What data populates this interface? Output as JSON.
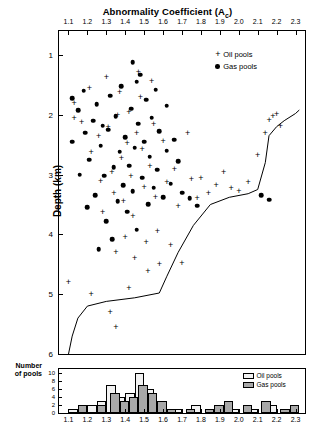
{
  "title": {
    "text": "Abnormality Coefficient (A",
    "sub": "c",
    "tail": ")"
  },
  "axes": {
    "x_label_top_ticks": [
      "1.1",
      "1.2",
      "1.3",
      "1.4",
      "1.5",
      "1.6",
      "1.7",
      "1.8",
      "1.9",
      "2.0",
      "2.1",
      "2.2",
      "2.3"
    ],
    "y_label": "Depth (km)",
    "y_ticks": [
      "1",
      "2",
      "3",
      "4",
      "5",
      "6"
    ],
    "hist_y_label_line1": "Number",
    "hist_y_label_line2": "of pools",
    "hist_y_ticks": [
      "0",
      "2",
      "4",
      "6",
      "8",
      "10"
    ],
    "hist_x_ticks": [
      "1.1",
      "1.2",
      "1.3",
      "1.4",
      "1.5",
      "1.6",
      "1.7",
      "1.8",
      "1.9",
      "2.0",
      "2.1",
      "2.2",
      "2.3"
    ]
  },
  "legend": {
    "oil": "Oil pools",
    "gas": "Gas pools"
  },
  "hist_legend": {
    "oil": "Oil pools",
    "gas": "Gas pools"
  },
  "colors": {
    "oil_bar": "#f2f2f2",
    "gas_bar": "#a8a8a8",
    "marker": "#000000",
    "axis": "#000000"
  },
  "chart_data": {
    "type": "scatter",
    "title": "Abnormality Coefficient (Ac)",
    "xlabel": "Abnormality Coefficient (Ac)",
    "ylabel": "Depth (km)",
    "xlim": [
      1.05,
      2.35
    ],
    "ylim_inverted": [
      0.6,
      6.0
    ],
    "grid": false,
    "legend_position": "top-right",
    "series": [
      {
        "name": "Oil pools",
        "marker": "plus",
        "points": [
          [
            1.13,
            1.8
          ],
          [
            1.13,
            2.05
          ],
          [
            1.17,
            2.12
          ],
          [
            1.21,
            1.55
          ],
          [
            1.22,
            2.62
          ],
          [
            1.26,
            2.36
          ],
          [
            1.27,
            3.1
          ],
          [
            1.28,
            3.62
          ],
          [
            1.3,
            1.37
          ],
          [
            1.31,
            2.2
          ],
          [
            1.33,
            2.95
          ],
          [
            1.34,
            3.3
          ],
          [
            1.35,
            4.3
          ],
          [
            1.36,
            2.0
          ],
          [
            1.37,
            1.62
          ],
          [
            1.38,
            2.72
          ],
          [
            1.39,
            3.45
          ],
          [
            1.4,
            4.05
          ],
          [
            1.41,
            2.48
          ],
          [
            1.42,
            1.95
          ],
          [
            1.43,
            3.02
          ],
          [
            1.44,
            3.7
          ],
          [
            1.45,
            4.4
          ],
          [
            1.46,
            2.3
          ],
          [
            1.47,
            1.28
          ],
          [
            1.48,
            1.7
          ],
          [
            1.49,
            2.58
          ],
          [
            1.5,
            3.2
          ],
          [
            1.51,
            4.12
          ],
          [
            1.52,
            4.62
          ],
          [
            1.53,
            2.86
          ],
          [
            1.54,
            1.44
          ],
          [
            1.55,
            2.16
          ],
          [
            1.56,
            3.38
          ],
          [
            1.57,
            3.95
          ],
          [
            1.58,
            4.5
          ],
          [
            1.6,
            2.44
          ],
          [
            1.62,
            3.12
          ],
          [
            1.64,
            4.18
          ],
          [
            1.66,
            2.9
          ],
          [
            1.68,
            3.52
          ],
          [
            1.7,
            4.48
          ],
          [
            1.73,
            2.3
          ],
          [
            1.75,
            3.08
          ],
          [
            1.78,
            3.4
          ],
          [
            1.8,
            3.05
          ],
          [
            1.84,
            3.3
          ],
          [
            1.88,
            3.18
          ],
          [
            1.92,
            2.95
          ],
          [
            1.96,
            3.22
          ],
          [
            2.0,
            3.28
          ],
          [
            2.05,
            3.12
          ],
          [
            2.1,
            2.68
          ],
          [
            2.14,
            2.3
          ],
          [
            2.16,
            2.08
          ],
          [
            2.18,
            2.02
          ],
          [
            2.2,
            1.98
          ],
          [
            2.22,
            2.18
          ],
          [
            1.1,
            4.8
          ],
          [
            1.22,
            5.0
          ],
          [
            1.32,
            5.3
          ],
          [
            1.35,
            5.55
          ],
          [
            1.42,
            4.9
          ]
        ]
      },
      {
        "name": "Gas pools",
        "marker": "circle",
        "points": [
          [
            1.12,
            1.72
          ],
          [
            1.15,
            1.92
          ],
          [
            1.18,
            1.6
          ],
          [
            1.19,
            2.3
          ],
          [
            1.21,
            2.75
          ],
          [
            1.23,
            2.1
          ],
          [
            1.24,
            3.35
          ],
          [
            1.25,
            1.82
          ],
          [
            1.27,
            2.52
          ],
          [
            1.29,
            3.02
          ],
          [
            1.3,
            3.78
          ],
          [
            1.31,
            2.25
          ],
          [
            1.32,
            1.68
          ],
          [
            1.33,
            4.08
          ],
          [
            1.34,
            2.88
          ],
          [
            1.35,
            2.02
          ],
          [
            1.36,
            3.45
          ],
          [
            1.37,
            2.62
          ],
          [
            1.38,
            1.52
          ],
          [
            1.39,
            3.18
          ],
          [
            1.4,
            2.38
          ],
          [
            1.41,
            3.62
          ],
          [
            1.42,
            2.85
          ],
          [
            1.43,
            1.9
          ],
          [
            1.44,
            3.28
          ],
          [
            1.45,
            2.55
          ],
          [
            1.46,
            3.92
          ],
          [
            1.47,
            2.15
          ],
          [
            1.48,
            1.33
          ],
          [
            1.49,
            3.05
          ],
          [
            1.5,
            2.45
          ],
          [
            1.51,
            1.75
          ],
          [
            1.52,
            3.5
          ],
          [
            1.53,
            2.7
          ],
          [
            1.54,
            2.05
          ],
          [
            1.55,
            3.22
          ],
          [
            1.56,
            1.58
          ],
          [
            1.57,
            2.92
          ],
          [
            1.58,
            2.28
          ],
          [
            1.6,
            3.38
          ],
          [
            1.62,
            2.6
          ],
          [
            1.64,
            3.15
          ],
          [
            1.66,
            2.42
          ],
          [
            1.7,
            3.3
          ],
          [
            1.74,
            3.4
          ],
          [
            1.78,
            3.52
          ],
          [
            1.12,
            2.45
          ],
          [
            1.16,
            3.0
          ],
          [
            1.2,
            3.55
          ],
          [
            1.26,
            4.25
          ],
          [
            1.28,
            2.18
          ],
          [
            1.44,
            1.12
          ],
          [
            1.46,
            1.45
          ],
          [
            1.62,
            1.85
          ],
          [
            1.68,
            2.78
          ],
          [
            2.12,
            3.35
          ],
          [
            2.16,
            3.42
          ]
        ]
      },
      {
        "name": "Trend line",
        "marker": "line",
        "points": [
          [
            1.1,
            6.0
          ],
          [
            1.12,
            5.7
          ],
          [
            1.15,
            5.4
          ],
          [
            1.2,
            5.2
          ],
          [
            1.3,
            5.12
          ],
          [
            1.45,
            5.06
          ],
          [
            1.58,
            4.98
          ],
          [
            1.62,
            4.7
          ],
          [
            1.68,
            4.3
          ],
          [
            1.76,
            3.85
          ],
          [
            1.85,
            3.5
          ],
          [
            1.95,
            3.38
          ],
          [
            2.05,
            3.32
          ],
          [
            2.1,
            3.25
          ],
          [
            2.14,
            2.8
          ],
          [
            2.16,
            2.35
          ],
          [
            2.2,
            2.2
          ],
          [
            2.24,
            2.1
          ],
          [
            2.3,
            1.98
          ],
          [
            2.32,
            1.92
          ]
        ]
      }
    ]
  },
  "hist_data": {
    "type": "bar",
    "xlabel": "Abnormality Coefficient (Ac)",
    "ylabel": "Number of pools",
    "ylim": [
      0,
      11
    ],
    "bin_width": 0.05,
    "series": [
      {
        "name": "Oil pools",
        "color": "#f2f2f2",
        "bins": [
          {
            "x": 1.125,
            "v": 1
          },
          {
            "x": 1.225,
            "v": 2
          },
          {
            "x": 1.275,
            "v": 3
          },
          {
            "x": 1.325,
            "v": 7
          },
          {
            "x": 1.375,
            "v": 4
          },
          {
            "x": 1.425,
            "v": 5
          },
          {
            "x": 1.475,
            "v": 10
          },
          {
            "x": 1.525,
            "v": 6
          },
          {
            "x": 1.575,
            "v": 3
          },
          {
            "x": 1.675,
            "v": 1
          },
          {
            "x": 1.775,
            "v": 2
          },
          {
            "x": 1.875,
            "v": 1
          },
          {
            "x": 1.975,
            "v": 1
          },
          {
            "x": 2.075,
            "v": 1
          },
          {
            "x": 2.175,
            "v": 2
          },
          {
            "x": 2.275,
            "v": 1
          }
        ]
      },
      {
        "name": "Gas pools",
        "color": "#a8a8a8",
        "bins": [
          {
            "x": 1.175,
            "v": 2
          },
          {
            "x": 1.275,
            "v": 2
          },
          {
            "x": 1.345,
            "v": 5
          },
          {
            "x": 1.395,
            "v": 3
          },
          {
            "x": 1.445,
            "v": 4
          },
          {
            "x": 1.495,
            "v": 7
          },
          {
            "x": 1.545,
            "v": 5
          },
          {
            "x": 1.595,
            "v": 3
          },
          {
            "x": 1.645,
            "v": 1
          },
          {
            "x": 1.745,
            "v": 1
          },
          {
            "x": 1.845,
            "v": 1
          },
          {
            "x": 1.895,
            "v": 2
          },
          {
            "x": 1.945,
            "v": 3
          },
          {
            "x": 2.045,
            "v": 2
          },
          {
            "x": 2.145,
            "v": 3
          },
          {
            "x": 2.245,
            "v": 1
          },
          {
            "x": 2.295,
            "v": 2
          }
        ]
      }
    ]
  }
}
